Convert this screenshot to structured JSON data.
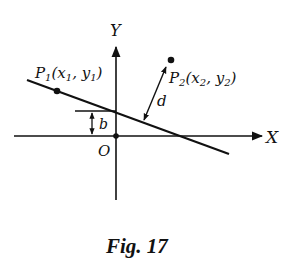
{
  "figure": {
    "caption": "Fig. 17",
    "axes": {
      "x_label": "X",
      "y_label": "Y",
      "origin_label": "O"
    },
    "points": [
      {
        "name": "P1",
        "label_main": "P",
        "label_sub": "1",
        "coords_text": "(x",
        "coords_sub1": "1",
        "coords_mid": ", y",
        "coords_sub2": "1",
        "coords_end": ")"
      },
      {
        "name": "P2",
        "label_main": "P",
        "label_sub": "2",
        "coords_text": "(x",
        "coords_sub1": "2",
        "coords_mid": ", y",
        "coords_sub2": "2",
        "coords_end": ")"
      }
    ],
    "distance_label": "d",
    "intercept_label": "b",
    "colors": {
      "ink": "#111111",
      "background": "#ffffff"
    }
  }
}
